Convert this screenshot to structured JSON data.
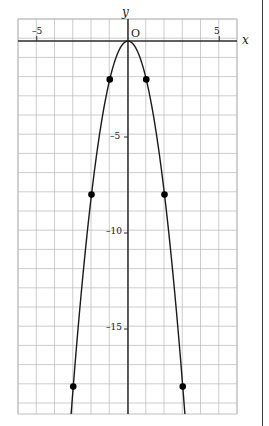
{
  "figure": {
    "background_color": "#ffffff",
    "grid_color": "#b8b8b8",
    "axis_color": "#2b2b2b",
    "curve_color": "#1a1a1a",
    "point_color": "#000000",
    "page_edge_color": "#3a3a3a"
  },
  "axes": {
    "x_axis_label": "x",
    "y_axis_label": "y",
    "origin_label": "O",
    "x_ticks": [
      {
        "value": -5,
        "label": "–5"
      },
      {
        "value": 5,
        "label": "5"
      }
    ],
    "y_ticks": [
      {
        "value": -5,
        "label": "–5"
      },
      {
        "value": -10,
        "label": "–10"
      },
      {
        "value": -15,
        "label": "–15"
      }
    ]
  },
  "chart_data": {
    "type": "line",
    "title": "",
    "xlabel": "x",
    "ylabel": "y",
    "xlim": [
      -6,
      6
    ],
    "ylim": [
      -19.5,
      1
    ],
    "grid": true,
    "grid_step_x": 1,
    "grid_step_y": 1,
    "legend": "none",
    "equation": "y = -2x^2",
    "series": [
      {
        "name": "y = -2x^2",
        "x": [
          -3.12,
          -3,
          -2.5,
          -2,
          -1.5,
          -1,
          -0.5,
          0,
          0.5,
          1,
          1.5,
          2,
          2.5,
          3,
          3.12
        ],
        "y": [
          -19.47,
          -18,
          -12.5,
          -8,
          -4.5,
          -2,
          -0.5,
          0,
          -0.5,
          -2,
          -4.5,
          -8,
          -12.5,
          -18,
          -19.47
        ]
      }
    ],
    "marked_points": [
      {
        "x": -3,
        "y": -18
      },
      {
        "x": -2,
        "y": -8
      },
      {
        "x": -1,
        "y": -2
      },
      {
        "x": 1,
        "y": -2
      },
      {
        "x": 2,
        "y": -8
      },
      {
        "x": 3,
        "y": -18
      }
    ],
    "vertex": {
      "x": 0,
      "y": 0
    }
  }
}
